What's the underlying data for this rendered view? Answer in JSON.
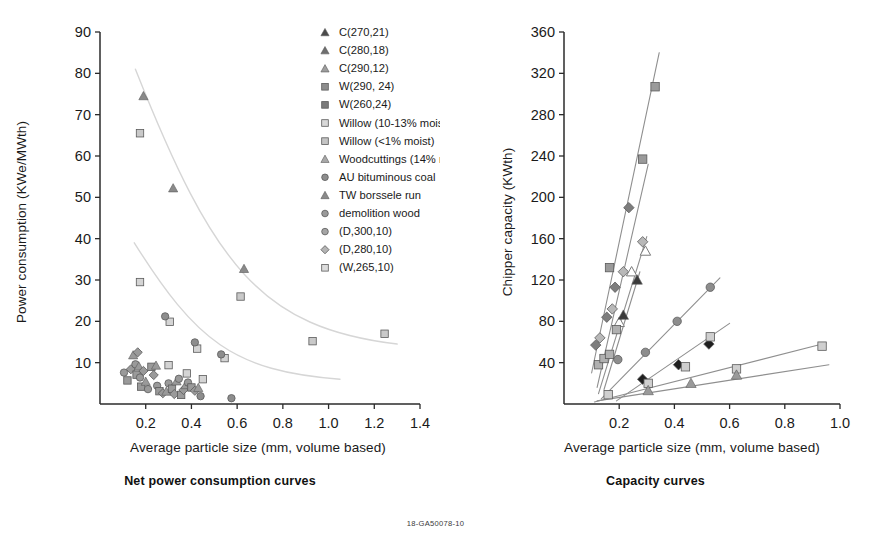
{
  "figure": {
    "footer_code": "18-GA50078-10",
    "colors": {
      "axis": "#2b2b2b",
      "text": "#1a1a1a",
      "marker_gray": "#8d8d8d",
      "marker_dark": "#4a4a4a",
      "marker_light": "#c9c9c9",
      "marker_black": "#232323",
      "trend_light": "#d0d0d0",
      "trend_mid": "#9a9a9a"
    }
  },
  "legend": {
    "items": [
      {
        "label": "C(270,21)",
        "marker": "triangle",
        "fill": "#4a4a4a"
      },
      {
        "label": "C(280,18)",
        "marker": "triangle",
        "fill": "#6e6e6e"
      },
      {
        "label": "C(290,12)",
        "marker": "triangle",
        "fill": "#9d9d9d"
      },
      {
        "label": "W(290, 24)",
        "marker": "square",
        "fill": "#8d8d8d"
      },
      {
        "label": "W(260,24)",
        "marker": "square",
        "fill": "#7a7a7a"
      },
      {
        "label": "Willow (10-13% moist)",
        "marker": "square",
        "fill": "#d8d8d8"
      },
      {
        "label": "Willow (<1% moist)",
        "marker": "square",
        "fill": "#c4c4c4"
      },
      {
        "label": "Woodcuttings (14% moist)",
        "marker": "triangle",
        "fill": "#a8a8a8"
      },
      {
        "label": "AU bituminous coal",
        "marker": "circle",
        "fill": "#8d8d8d"
      },
      {
        "label": "TW borssele run",
        "marker": "triangle",
        "fill": "#8a8a8a"
      },
      {
        "label": "demolition wood",
        "marker": "circle",
        "fill": "#9a9a9a"
      },
      {
        "label": "(D,300,10)",
        "marker": "circle",
        "fill": "#a5a5a5"
      },
      {
        "label": "(D,280,10)",
        "marker": "diamond",
        "fill": "#b4b4b4"
      },
      {
        "label": "(W,265,10)",
        "marker": "square",
        "fill": "#dcdcdc"
      }
    ]
  },
  "chart_data": [
    {
      "type": "scatter",
      "title": "Net power consumption curves",
      "xlabel": "Average particle size (mm, volume based)",
      "ylabel": "Power consumption (KWe/MWth)",
      "xlim": [
        0,
        1.4
      ],
      "ylim": [
        0,
        90
      ],
      "xticks": [
        "0.2",
        "0.4",
        "0.6",
        "0.8",
        "1.0",
        "1.2",
        "1.4"
      ],
      "xtick_values": [
        0.2,
        0.4,
        0.6,
        0.8,
        1.0,
        1.2,
        1.4
      ],
      "yticks": [
        "10",
        "20",
        "30",
        "40",
        "50",
        "60",
        "70",
        "80",
        "90"
      ],
      "ytick_values": [
        10,
        20,
        30,
        40,
        50,
        60,
        70,
        80,
        90
      ],
      "grid": false,
      "legend_position": "inside-top-right",
      "series": [
        {
          "name": "upper branch",
          "marker": "triangle",
          "fill": "#8a8a8a",
          "points": [
            [
              0.19,
              74.5
            ],
            [
              0.32,
              52.2
            ],
            [
              0.63,
              32.7
            ]
          ]
        },
        {
          "name": "upper branch squares",
          "marker": "square",
          "fill": "#c9c9c9",
          "points": [
            [
              0.175,
              65.5
            ],
            [
              0.615,
              26.0
            ],
            [
              0.93,
              15.2
            ],
            [
              1.245,
              17.0
            ]
          ]
        },
        {
          "name": "lower branch",
          "marker": "square",
          "fill": "#d4d4d4",
          "points": [
            [
              0.175,
              29.5
            ],
            [
              0.305,
              19.9
            ],
            [
              0.425,
              13.4
            ],
            [
              0.545,
              11.1
            ],
            [
              0.38,
              7.4
            ],
            [
              0.45,
              6.0
            ],
            [
              0.3,
              9.4
            ]
          ]
        },
        {
          "name": "lower branch circles",
          "marker": "circle",
          "fill": "#8d8d8d",
          "points": [
            [
              0.285,
              21.2
            ],
            [
              0.415,
              14.9
            ],
            [
              0.53,
              12.0
            ],
            [
              0.44,
              1.9
            ],
            [
              0.575,
              1.4
            ]
          ]
        },
        {
          "name": "dense cluster",
          "marker": "mixed",
          "fill": "#9a9a9a",
          "points": [
            [
              0.105,
              7.6
            ],
            [
              0.12,
              5.7
            ],
            [
              0.135,
              8.4
            ],
            [
              0.145,
              11.8
            ],
            [
              0.155,
              9.6
            ],
            [
              0.16,
              7.1
            ],
            [
              0.165,
              12.5
            ],
            [
              0.17,
              9.1
            ],
            [
              0.175,
              6.4
            ],
            [
              0.18,
              4.2
            ],
            [
              0.19,
              8.0
            ],
            [
              0.2,
              5.4
            ],
            [
              0.21,
              3.6
            ],
            [
              0.225,
              9.0
            ],
            [
              0.235,
              7.0
            ],
            [
              0.245,
              9.3
            ],
            [
              0.25,
              4.4
            ],
            [
              0.26,
              3.1
            ],
            [
              0.275,
              2.6
            ],
            [
              0.29,
              3.0
            ],
            [
              0.3,
              5.0
            ],
            [
              0.315,
              3.7
            ],
            [
              0.325,
              2.4
            ],
            [
              0.335,
              5.5
            ],
            [
              0.345,
              6.1
            ],
            [
              0.355,
              2.2
            ],
            [
              0.365,
              3.4
            ],
            [
              0.375,
              4.6
            ],
            [
              0.385,
              5.2
            ],
            [
              0.4,
              4.0
            ],
            [
              0.415,
              3.2
            ],
            [
              0.43,
              3.9
            ]
          ]
        }
      ],
      "trendlines": [
        {
          "name": "upper decay",
          "from": [
            0.155,
            81
          ],
          "to": [
            1.3,
            14.5
          ]
        },
        {
          "name": "lower decay",
          "from": [
            0.15,
            39
          ],
          "to": [
            1.05,
            6.0
          ]
        }
      ]
    },
    {
      "type": "scatter",
      "title": "Capacity curves",
      "xlabel": "Average particle size (mm, volume based)",
      "ylabel": "Chipper capacity (KWth)",
      "xlim": [
        0,
        1.0
      ],
      "ylim": [
        0,
        360
      ],
      "xticks": [
        "0.2",
        "0.4",
        "0.6",
        "0.8",
        "1.0"
      ],
      "xtick_values": [
        0.2,
        0.4,
        0.6,
        0.8,
        1.0
      ],
      "yticks": [
        "40",
        "80",
        "120",
        "160",
        "200",
        "240",
        "280",
        "320",
        "360"
      ],
      "ytick_values": [
        40,
        80,
        120,
        160,
        200,
        240,
        280,
        320,
        360
      ],
      "grid": false,
      "legend_position": "none",
      "series": [
        {
          "name": "steep squares",
          "marker": "square",
          "fill": "#9a9a9a",
          "points": [
            [
              0.165,
              132
            ],
            [
              0.285,
              237
            ],
            [
              0.33,
              307
            ]
          ]
        },
        {
          "name": "steep diamonds dark",
          "marker": "diamond",
          "fill": "#7d7d7d",
          "points": [
            [
              0.115,
              57
            ],
            [
              0.155,
              84
            ],
            [
              0.185,
              113
            ],
            [
              0.235,
              190
            ]
          ]
        },
        {
          "name": "light diamonds",
          "marker": "diamond",
          "fill": "#b8b8b8",
          "points": [
            [
              0.13,
              64
            ],
            [
              0.175,
              92
            ],
            [
              0.215,
              128
            ],
            [
              0.285,
              157
            ]
          ]
        },
        {
          "name": "open triangles",
          "marker": "triangle-open",
          "fill": "#ffffff",
          "points": [
            [
              0.2,
              79
            ],
            [
              0.245,
              128
            ],
            [
              0.295,
              148
            ]
          ]
        },
        {
          "name": "dark triangles",
          "marker": "triangle",
          "fill": "#3a3a3a",
          "points": [
            [
              0.215,
              86
            ],
            [
              0.265,
              120
            ]
          ]
        },
        {
          "name": "mid circles",
          "marker": "circle",
          "fill": "#8d8d8d",
          "points": [
            [
              0.195,
              43
            ],
            [
              0.295,
              50
            ],
            [
              0.41,
              80
            ],
            [
              0.53,
              113
            ]
          ]
        },
        {
          "name": "black diamonds",
          "marker": "diamond",
          "fill": "#1f1f1f",
          "points": [
            [
              0.285,
              24
            ],
            [
              0.415,
              38
            ],
            [
              0.525,
              58
            ]
          ]
        },
        {
          "name": "light squares rising",
          "marker": "square",
          "fill": "#cfcfcf",
          "points": [
            [
              0.16,
              9
            ],
            [
              0.305,
              20
            ],
            [
              0.44,
              36
            ],
            [
              0.53,
              65
            ],
            [
              0.625,
              34
            ],
            [
              0.935,
              56
            ]
          ]
        },
        {
          "name": "shallow triangles",
          "marker": "triangle",
          "fill": "#9a9a9a",
          "points": [
            [
              0.305,
              13
            ],
            [
              0.46,
              20
            ],
            [
              0.625,
              28
            ]
          ]
        },
        {
          "name": "small cluster squares",
          "marker": "square",
          "fill": "#b0b0b0",
          "points": [
            [
              0.125,
              38
            ],
            [
              0.145,
              44
            ],
            [
              0.165,
              48
            ],
            [
              0.19,
              72
            ]
          ]
        }
      ],
      "trendlines": [
        {
          "name": "line-1",
          "from": [
            0.1,
            30
          ],
          "to": [
            0.345,
            340
          ]
        },
        {
          "name": "line-2",
          "from": [
            0.12,
            16
          ],
          "to": [
            0.305,
            232
          ]
        },
        {
          "name": "line-3",
          "from": [
            0.125,
            10
          ],
          "to": [
            0.3,
            162
          ]
        },
        {
          "name": "line-4",
          "from": [
            0.145,
            14
          ],
          "to": [
            0.275,
            128
          ]
        },
        {
          "name": "line-5",
          "from": [
            0.135,
            5
          ],
          "to": [
            0.565,
            122
          ]
        },
        {
          "name": "line-6",
          "from": [
            0.19,
            3
          ],
          "to": [
            0.6,
            78
          ]
        },
        {
          "name": "line-7",
          "from": [
            0.11,
            2
          ],
          "to": [
            0.95,
            59
          ]
        },
        {
          "name": "line-8",
          "from": [
            0.12,
            3
          ],
          "to": [
            0.96,
            38
          ]
        }
      ]
    }
  ]
}
